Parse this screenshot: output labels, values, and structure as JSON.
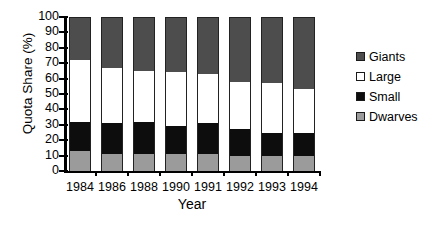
{
  "chart_data": {
    "type": "bar",
    "subtype": "stacked-bar-100",
    "title": "",
    "xlabel": "Year",
    "ylabel": "Quota Share (%)",
    "categories": [
      "1984",
      "1986",
      "1988",
      "1990",
      "1991",
      "1992",
      "1993",
      "1994"
    ],
    "ylim": [
      0,
      100
    ],
    "yticks": [
      0,
      10,
      20,
      30,
      40,
      50,
      60,
      70,
      80,
      90,
      100
    ],
    "ytick_labels": [
      "0",
      "10",
      "20",
      "30",
      "40",
      "50",
      "60",
      "70",
      "80",
      "90",
      "100"
    ],
    "grid": false,
    "legend_position": "right",
    "series": [
      {
        "name": "Giants",
        "color": "#4d4d4d",
        "values": [
          28,
          33,
          35,
          36,
          37,
          42,
          43,
          47
        ]
      },
      {
        "name": "Large",
        "color": "#ffffff",
        "values": [
          40,
          36,
          33,
          35,
          32,
          31,
          32,
          28
        ]
      },
      {
        "name": "Small",
        "color": "#0d0d0d",
        "values": [
          19,
          20,
          21,
          18,
          20,
          17,
          15,
          15
        ]
      },
      {
        "name": "Dwarves",
        "color": "#9b9b9b",
        "values": [
          13,
          11,
          11,
          11,
          11,
          10,
          10,
          10
        ]
      }
    ],
    "stack_order_bottom_to_top": [
      "Dwarves",
      "Small",
      "Large",
      "Giants"
    ],
    "cumulative_tops": {
      "Dwarves": [
        13,
        11,
        11,
        11,
        11,
        10,
        10,
        10
      ],
      "Small": [
        32,
        31,
        32,
        29,
        31,
        27,
        25,
        25
      ],
      "Large": [
        72,
        67,
        65,
        64,
        63,
        58,
        57,
        53
      ],
      "Giants": [
        100,
        100,
        100,
        100,
        100,
        100,
        100,
        100
      ]
    }
  },
  "legend": {
    "items": [
      {
        "label": "Giants",
        "color": "#4d4d4d"
      },
      {
        "label": "Large",
        "color": "#ffffff"
      },
      {
        "label": "Small",
        "color": "#0d0d0d"
      },
      {
        "label": "Dwarves",
        "color": "#9b9b9b"
      }
    ]
  }
}
